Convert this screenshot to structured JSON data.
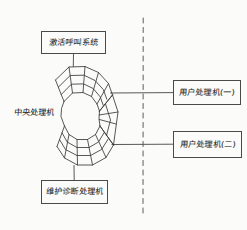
{
  "diagram": {
    "style": "hand-drawn pencil sketch",
    "ink_color": "#3a3a38",
    "background_color": "#fbfbfa",
    "nodes": {
      "call_system": {
        "label": "激活呼叫系统",
        "position": "top"
      },
      "maintenance_processor": {
        "label": "维护诊断处理机",
        "position": "bottom"
      },
      "user_processor_1": {
        "label": "用户处理机(一)",
        "position": "right-upper"
      },
      "user_processor_2": {
        "label": "用户处理机(二)",
        "position": "right-lower"
      },
      "central_processor": {
        "label": "中央处理机",
        "position": "left-center",
        "shape": "segmented-c-ring"
      }
    },
    "connectors": [
      {
        "name": "call-system-to-cpu",
        "from": "call_system",
        "to": "central_processor",
        "style": "solid",
        "orientation": "vertical"
      },
      {
        "name": "cpu-to-maintenance",
        "from": "central_processor",
        "to": "maintenance_processor",
        "style": "solid",
        "orientation": "vertical"
      },
      {
        "name": "cpu-to-user-proc-1",
        "from": "central_processor",
        "to": "user_processor_1",
        "style": "solid",
        "orientation": "horizontal"
      },
      {
        "name": "cpu-to-user-proc-2",
        "from": "central_processor",
        "to": "user_processor_2",
        "style": "solid",
        "orientation": "horizontal"
      }
    ],
    "divider": {
      "name": "boundary-divider",
      "style": "dashed",
      "orientation": "vertical",
      "x": 143
    }
  }
}
